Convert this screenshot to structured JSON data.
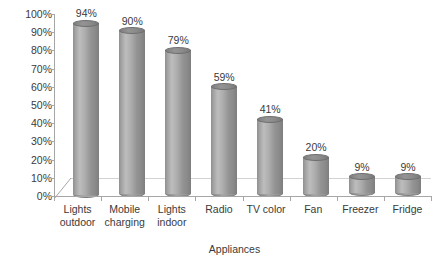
{
  "chart_data": {
    "type": "bar",
    "title": "",
    "subtitle": "",
    "xlabel": "Appliances",
    "ylabel": "",
    "categories": [
      "Lights outdoor",
      "Mobile charging",
      "Lights indoor",
      "Radio",
      "TV color",
      "Fan",
      "Freezer",
      "Fridge"
    ],
    "values": [
      94,
      90,
      79,
      59,
      41,
      20,
      9,
      9
    ],
    "data_labels": [
      "94%",
      "90%",
      "79%",
      "59%",
      "41%",
      "20%",
      "9%",
      "9%"
    ],
    "ylim": [
      0,
      100
    ],
    "ytick_values": [
      0,
      10,
      20,
      30,
      40,
      50,
      60,
      70,
      80,
      90,
      100
    ],
    "ytick_labels": [
      "0%",
      "10%",
      "20%",
      "30%",
      "40%",
      "50%",
      "60%",
      "70%",
      "80%",
      "90%",
      "100%"
    ],
    "grid": false,
    "legend": "none",
    "style": "3d-cylinder",
    "colors": {
      "bar_light": "#bdbdbd",
      "bar_mid": "#a3a3a3",
      "bar_dark": "#7e7e7e",
      "axis_line": "#a6a6a6",
      "text": "#3a3a3a",
      "background": "#ffffff"
    }
  }
}
